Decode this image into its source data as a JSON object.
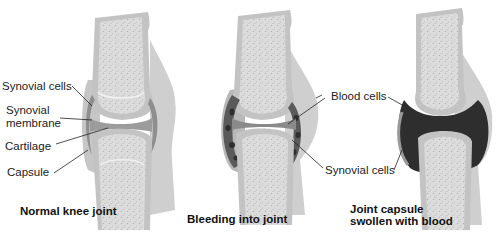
{
  "figure": {
    "panels": [
      {
        "id": "normal",
        "caption": "Normal knee joint",
        "labels": [
          "Synovial cells",
          "Synovial membrane",
          "Cartilage",
          "Capsule"
        ]
      },
      {
        "id": "bleeding",
        "caption": "Bleeding into joint",
        "labels": [
          "Blood cells",
          "Synovial cells"
        ]
      },
      {
        "id": "swollen",
        "caption_line1": "Joint capsule",
        "caption_line2": "swollen with blood"
      }
    ],
    "labels": {
      "synovial_cells_left": "Synovial cells",
      "synovial_line1": "Synovial",
      "synovial_line2": "membrane",
      "cartilage": "Cartilage",
      "capsule": "Capsule",
      "blood_cells": "Blood cells",
      "synovial_cells_right": "Synovial cells"
    },
    "captions": {
      "normal": "Normal knee joint",
      "bleeding": "Bleeding into joint",
      "swollen_line1": "Joint capsule",
      "swollen_line2": "swollen with blood"
    },
    "colors": {
      "capsule_fill": "#c9c9c9",
      "bone_outline": "#bdbdbd",
      "marrow": "#d8d8d8",
      "cartilage": "#a9a9a9",
      "blood": "#2e2e2e",
      "text": "#222222"
    }
  }
}
